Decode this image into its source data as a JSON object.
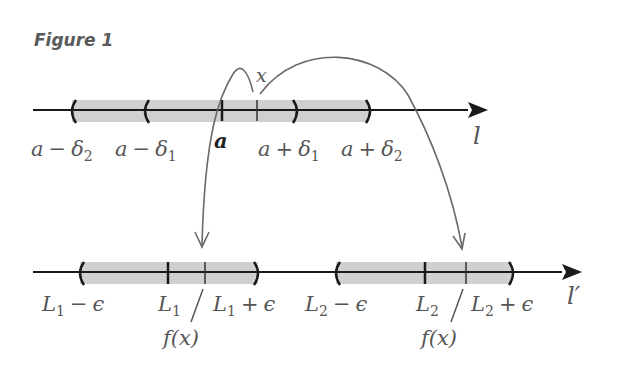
{
  "title": "Figure 1",
  "top_line": {
    "axis_label": "l",
    "point_x": "x",
    "center": "a",
    "labels": {
      "minus_d2_a": "a",
      "minus_d2_op": "−",
      "minus_d2_d": "δ",
      "minus_d2_sub": "2",
      "minus_d1_a": "a",
      "minus_d1_op": "−",
      "minus_d1_d": "δ",
      "minus_d1_sub": "1",
      "plus_d1_a": "a",
      "plus_d1_op": "+",
      "plus_d1_d": "δ",
      "plus_d1_sub": "1",
      "plus_d2_a": "a",
      "plus_d2_op": "+",
      "plus_d2_d": "δ",
      "plus_d2_sub": "2"
    }
  },
  "bottom_line": {
    "axis_label": "l′",
    "fx_label": "f(x)",
    "labels": {
      "L1": "L",
      "L1_sub": "1",
      "L1m_L": "L",
      "L1m_sub": "1",
      "L1m_op": "−",
      "L1m_e": "ϵ",
      "L1p_L": "L",
      "L1p_sub": "1",
      "L1p_op": "+",
      "L1p_e": "ϵ",
      "L2": "L",
      "L2_sub": "2",
      "L2m_L": "L",
      "L2m_sub": "2",
      "L2m_op": "−",
      "L2m_e": "ϵ",
      "L2p_L": "L",
      "L2p_sub": "2",
      "L2p_op": "+",
      "L2p_e": "ϵ"
    }
  },
  "colors": {
    "band": "#cfcfcf",
    "line": "#1a1a1a",
    "curve": "#6a6a6a"
  }
}
